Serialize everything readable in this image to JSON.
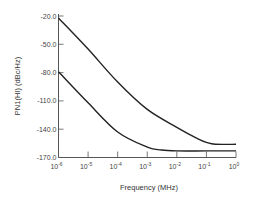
{
  "chart_data": {
    "type": "line",
    "title": "",
    "xlabel": "Frequency (MHz)",
    "ylabel": "PN1(HI) (dBc/Hz)",
    "xscale": "log",
    "xlim": [
      1e-06,
      1
    ],
    "ylim": [
      -170,
      -20
    ],
    "grid": false,
    "legend": null,
    "x_ticks": [
      {
        "base": "10",
        "exp": "-6",
        "value": 1e-06
      },
      {
        "base": "10",
        "exp": "-5",
        "value": 1e-05
      },
      {
        "base": "10",
        "exp": "-4",
        "value": 0.0001
      },
      {
        "base": "10",
        "exp": "-3",
        "value": 0.001
      },
      {
        "base": "10",
        "exp": "-2",
        "value": 0.01
      },
      {
        "base": "10",
        "exp": "-1",
        "value": 0.1
      },
      {
        "base": "10",
        "exp": "0",
        "value": 1
      }
    ],
    "y_ticks": [
      "-20.0",
      "-50.0",
      "-80.0",
      "-110.0",
      "-140.0",
      "-170.0"
    ],
    "series": [
      {
        "name": "upper curve",
        "x": [
          1e-06,
          1e-05,
          0.0001,
          0.001,
          0.01,
          0.05,
          0.1,
          0.2,
          1
        ],
        "y": [
          -22,
          -55,
          -90,
          -119,
          -138,
          -150,
          -154,
          -156,
          -156
        ]
      },
      {
        "name": "lower curve",
        "x": [
          1e-06,
          1e-05,
          0.0001,
          0.001,
          0.003,
          0.01,
          0.1,
          1
        ],
        "y": [
          -79,
          -112,
          -143,
          -159,
          -162,
          -163,
          -163,
          -163
        ]
      }
    ]
  }
}
